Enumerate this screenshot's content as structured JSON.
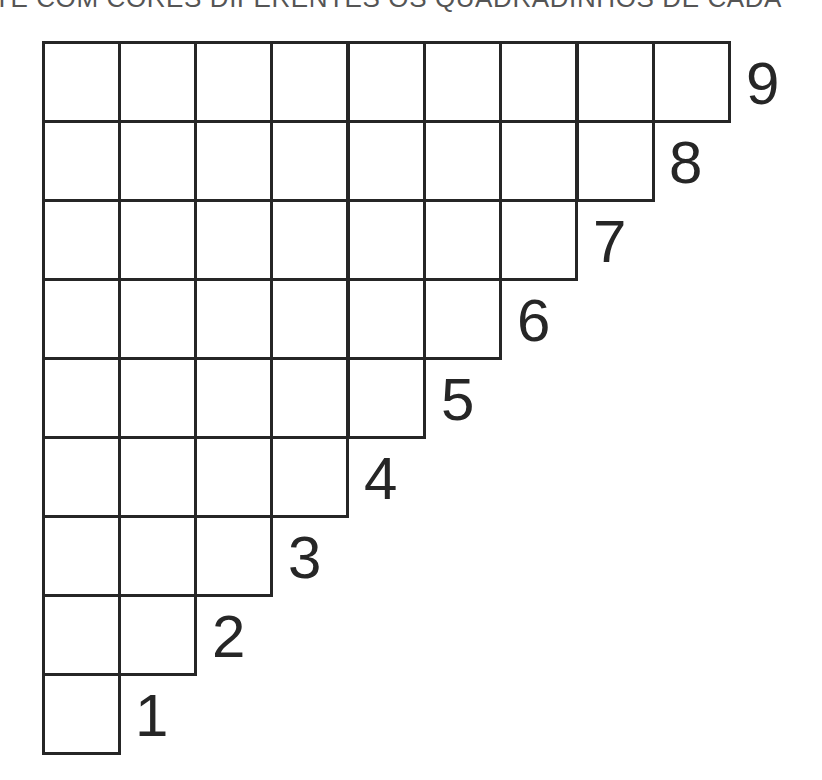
{
  "worksheet": {
    "instruction": "TE COM CORES DIFERENTES OS QUADRADINHOS DE CADA",
    "grid": {
      "origin_x": 43,
      "origin_y": 42,
      "cell_width": 76.3,
      "cell_height": 79,
      "line_color": "#262626",
      "rows": [
        {
          "label": "9",
          "cells": 9
        },
        {
          "label": "8",
          "cells": 8
        },
        {
          "label": "7",
          "cells": 7
        },
        {
          "label": "6",
          "cells": 6
        },
        {
          "label": "5",
          "cells": 5
        },
        {
          "label": "4",
          "cells": 4
        },
        {
          "label": "3",
          "cells": 3
        },
        {
          "label": "2",
          "cells": 2
        },
        {
          "label": "1",
          "cells": 1
        }
      ]
    }
  }
}
